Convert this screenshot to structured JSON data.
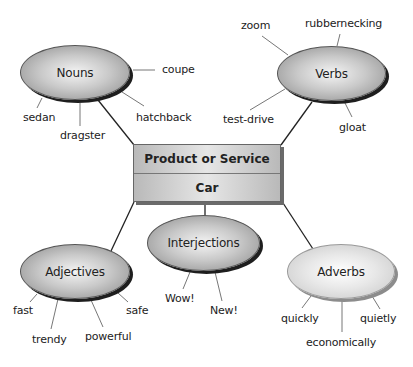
{
  "center": {
    "title": "Product or Service",
    "value": "Car"
  },
  "nodes": {
    "nouns": {
      "label": "Nouns",
      "leaves": [
        "coupe",
        "sedan",
        "dragster",
        "hatchback"
      ]
    },
    "verbs": {
      "label": "Verbs",
      "leaves": [
        "zoom",
        "rubbernecking",
        "test-drive",
        "gloat"
      ]
    },
    "adjectives": {
      "label": "Adjectives",
      "leaves": [
        "fast",
        "safe",
        "trendy",
        "powerful"
      ]
    },
    "interjections": {
      "label": "Interjections",
      "leaves": [
        "Wow!",
        "New!"
      ]
    },
    "adverbs": {
      "label": "Adverbs",
      "leaves": [
        "quickly",
        "quietly",
        "economically"
      ]
    }
  },
  "colors": {
    "dark_node_fill": "#b0b0b0",
    "light_node_fill": "#dcdcdc",
    "box_fill": "#d0d0d0",
    "line": "#222222",
    "leaf_line": "#777777"
  }
}
